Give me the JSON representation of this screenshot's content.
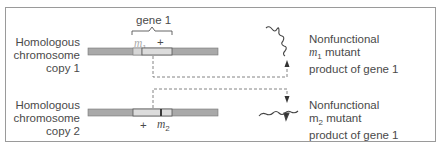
{
  "diagram": {
    "gene_label": "gene 1",
    "copy1": {
      "label_lines": [
        "Homologous",
        "chromosome",
        "copy 1"
      ],
      "allele_left": "m",
      "allele_left_sub": "1",
      "allele_right": "+"
    },
    "copy2": {
      "label_lines": [
        "Homologous",
        "chromosome",
        "copy 2"
      ],
      "allele_left": "+",
      "allele_right": "m",
      "allele_right_sub": "2"
    },
    "product1": {
      "line1": "Nonfunctional",
      "line2_sym": "m",
      "line2_sub": "1",
      "line2_rest": " mutant",
      "line3": "product of gene 1"
    },
    "product2": {
      "line1": "Nonfunctional",
      "line2_sym": "m",
      "line2_sub": "2",
      "line2_rest": " mutant",
      "line3": "product of gene 1"
    },
    "colors": {
      "chromosome_gray": "#a9a9a9",
      "gene_region": "#dcdcdc",
      "mutation_mark": "#3a3a3a",
      "border": "#9a9a9a",
      "text": "#4a4a4a"
    }
  }
}
